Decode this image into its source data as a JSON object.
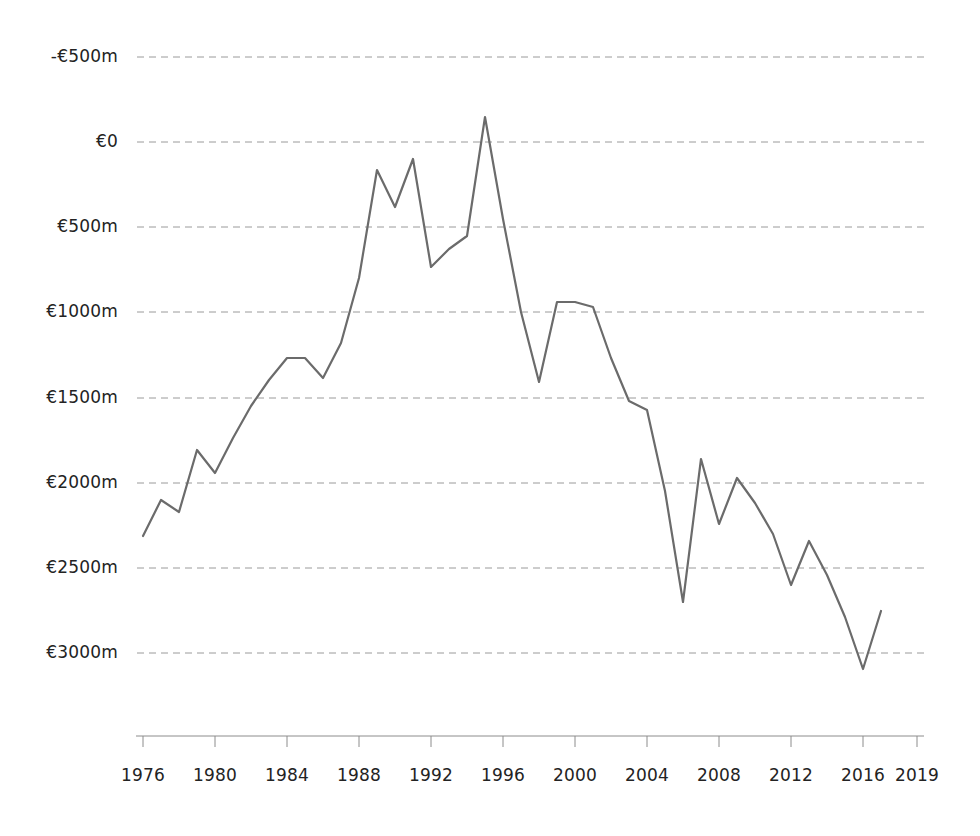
{
  "chart_data": {
    "type": "line",
    "title": "",
    "subtitle": "",
    "xlabel": "",
    "ylabel": "",
    "legend": [],
    "legend_position": "none",
    "grid": true,
    "grid_style": "dashed-horizontal",
    "line_color": "#6b6b6b",
    "grid_color": "#9a9a9a",
    "axis_color": "#8c8c8c",
    "text_color": "#232323",
    "background_color": "#ffffff",
    "xlim": [
      1976,
      2019
    ],
    "ylim": [
      -500,
      3000
    ],
    "y_ticks": [
      -500,
      0,
      500,
      1000,
      1500,
      2000,
      2500,
      3000
    ],
    "y_tick_labels": [
      "-€500m",
      "€0",
      "€500m",
      "€1000m",
      "€1500m",
      "€2000m",
      "€2500m",
      "€3000m"
    ],
    "x_ticks": [
      1976,
      1980,
      1984,
      1988,
      1992,
      1996,
      2000,
      2004,
      2008,
      2012,
      2016,
      2019
    ],
    "x_tick_labels": [
      "1976",
      "1980",
      "1984",
      "1988",
      "1992",
      "1996",
      "2000",
      "2004",
      "2008",
      "2012",
      "2016",
      "2019"
    ],
    "x": [
      1976,
      1977,
      1978,
      1979,
      1980,
      1981,
      1982,
      1983,
      1984,
      1985,
      1986,
      1987,
      1988,
      1989,
      1990,
      1991,
      1992,
      1993,
      1994,
      1995,
      1996,
      1997,
      1998,
      1999,
      2000,
      2001,
      2002,
      2003,
      2004,
      2005,
      2006,
      2007,
      2008,
      2009,
      2010,
      2011,
      2012,
      2013,
      2014,
      2015,
      2016,
      2017,
      2018,
      2019
    ],
    "values": [
      190,
      400,
      330,
      690,
      560,
      760,
      950,
      1100,
      1230,
      1230,
      1110,
      1320,
      1700,
      2335,
      2120,
      2400,
      1770,
      1870,
      1950,
      2650,
      2050,
      1500,
      1090,
      1560,
      1560,
      1530,
      1230,
      980,
      930,
      450,
      -200,
      640,
      260,
      530,
      380,
      200,
      -100,
      160,
      -40,
      -290,
      -590,
      -250,
      null,
      null
    ],
    "series": [
      {
        "name": "Amount",
        "points": [
          {
            "x": 1976,
            "y": 190
          },
          {
            "x": 1977,
            "y": 400
          },
          {
            "x": 1978,
            "y": 330
          },
          {
            "x": 1979,
            "y": 690
          },
          {
            "x": 1980,
            "y": 560
          },
          {
            "x": 1981,
            "y": 760
          },
          {
            "x": 1982,
            "y": 950
          },
          {
            "x": 1983,
            "y": 1100
          },
          {
            "x": 1984,
            "y": 1230
          },
          {
            "x": 1985,
            "y": 1230
          },
          {
            "x": 1986,
            "y": 1110
          },
          {
            "x": 1987,
            "y": 1320
          },
          {
            "x": 1988,
            "y": 1700
          },
          {
            "x": 1989,
            "y": 2335
          },
          {
            "x": 1990,
            "y": 2120
          },
          {
            "x": 1991,
            "y": 2400
          },
          {
            "x": 1992,
            "y": 1770
          },
          {
            "x": 1993,
            "y": 1870
          },
          {
            "x": 1994,
            "y": 1950
          },
          {
            "x": 1995,
            "y": 2650
          },
          {
            "x": 1996,
            "y": 2050
          },
          {
            "x": 1997,
            "y": 1500
          },
          {
            "x": 1998,
            "y": 1090
          },
          {
            "x": 1999,
            "y": 1560
          },
          {
            "x": 2000,
            "y": 1560
          },
          {
            "x": 2001,
            "y": 1530
          },
          {
            "x": 2002,
            "y": 1230
          },
          {
            "x": 2003,
            "y": 980
          },
          {
            "x": 2004,
            "y": 930
          },
          {
            "x": 2005,
            "y": 450
          },
          {
            "x": 2006,
            "y": -200
          },
          {
            "x": 2007,
            "y": 640
          },
          {
            "x": 2008,
            "y": 260
          },
          {
            "x": 2009,
            "y": 530
          },
          {
            "x": 2010,
            "y": 380
          },
          {
            "x": 2011,
            "y": 200
          },
          {
            "x": 2012,
            "y": -100
          },
          {
            "x": 2013,
            "y": 160
          },
          {
            "x": 2014,
            "y": -40
          },
          {
            "x": 2015,
            "y": -290
          },
          {
            "x": 2016,
            "y": -590
          },
          {
            "x": 2017,
            "y": -250
          }
        ]
      }
    ],
    "plot_points_px": [
      [
        143,
        536
      ],
      [
        161,
        500
      ],
      [
        179,
        512
      ],
      [
        197,
        450
      ],
      [
        215,
        473
      ],
      [
        233,
        438
      ],
      [
        251,
        406
      ],
      [
        269,
        380
      ],
      [
        287,
        358
      ],
      [
        305,
        358
      ],
      [
        323,
        378
      ],
      [
        341,
        343
      ],
      [
        359,
        278
      ],
      [
        377,
        170
      ],
      [
        395,
        207
      ],
      [
        413,
        159
      ],
      [
        431,
        267
      ],
      [
        449,
        249
      ],
      [
        467,
        236
      ],
      [
        485,
        117
      ],
      [
        503,
        219
      ],
      [
        521,
        312
      ],
      [
        539,
        382
      ],
      [
        557,
        302
      ],
      [
        575,
        302
      ],
      [
        593,
        307
      ],
      [
        611,
        358
      ],
      [
        629,
        401
      ],
      [
        647,
        410
      ],
      [
        665,
        491
      ],
      [
        683,
        602
      ],
      [
        701,
        459
      ],
      [
        719,
        524
      ],
      [
        737,
        478
      ],
      [
        755,
        503
      ],
      [
        773,
        534
      ],
      [
        791,
        585
      ],
      [
        809,
        541
      ],
      [
        827,
        575
      ],
      [
        845,
        617
      ],
      [
        863,
        669
      ],
      [
        881,
        611
      ]
    ]
  },
  "y_tick_positions_px": [
    57,
    142,
    227,
    312,
    398,
    483,
    568,
    653
  ],
  "x_axis_px": {
    "axis_y": 736,
    "tick_xs": [
      143,
      215,
      287,
      359,
      431,
      503,
      575,
      647,
      719,
      791,
      863,
      917
    ],
    "label_y": 765
  }
}
